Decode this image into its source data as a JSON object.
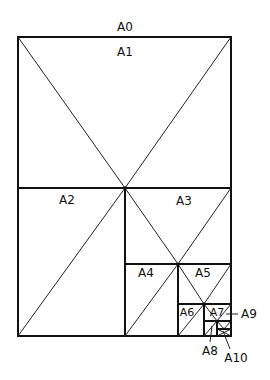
{
  "diagram": {
    "labels": {
      "a0": "A0",
      "a1": "A1",
      "a2": "A2",
      "a3": "A3",
      "a4": "A4",
      "a5": "A5",
      "a6": "A6",
      "a7": "A7",
      "a8": "A8",
      "a9": "A9",
      "a10": "A10"
    },
    "colors": {
      "line": "#111111",
      "background": "#ffffff"
    }
  }
}
